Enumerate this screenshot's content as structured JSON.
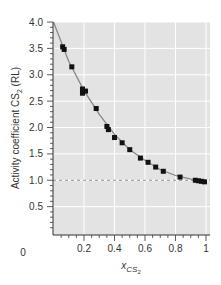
{
  "chart_data": {
    "type": "scatter",
    "title": "",
    "xlabel": "x_CS2",
    "ylabel": "Activity coefficient CS2 (RL)",
    "xlim": [
      0,
      1
    ],
    "ylim": [
      0,
      4.0
    ],
    "x_ticks": [
      "0",
      "0.2",
      "0.4",
      "0.6",
      "0.8",
      "1"
    ],
    "y_ticks": [
      "0.5",
      "1.0",
      "1.5",
      "2.0",
      "2.5",
      "3.0",
      "3.5",
      "4.0"
    ],
    "grid": true,
    "legend": null,
    "reference_line": {
      "y": 1.0,
      "style": "dashed"
    },
    "series": [
      {
        "name": "measured",
        "marker": "square",
        "x": [
          0.06,
          0.07,
          0.12,
          0.19,
          0.21,
          0.19,
          0.28,
          0.35,
          0.36,
          0.4,
          0.45,
          0.5,
          0.57,
          0.62,
          0.67,
          0.72,
          0.83,
          0.93,
          0.95,
          0.97,
          0.99
        ],
        "y": [
          3.53,
          3.48,
          3.15,
          2.73,
          2.69,
          2.65,
          2.36,
          2.02,
          1.96,
          1.81,
          1.71,
          1.58,
          1.42,
          1.34,
          1.25,
          1.17,
          1.06,
          1.0,
          0.99,
          0.98,
          0.97
        ]
      },
      {
        "name": "fit",
        "style": "line",
        "x": [
          0.0,
          0.1,
          0.2,
          0.3,
          0.4,
          0.5,
          0.6,
          0.7,
          0.8,
          0.9,
          1.0
        ],
        "y": [
          4.0,
          3.25,
          2.7,
          2.25,
          1.87,
          1.58,
          1.38,
          1.2,
          1.09,
          1.02,
          0.97
        ]
      }
    ]
  },
  "labels": {
    "ylabel_main": "Activity coefficient CS",
    "ylabel_sub": "2",
    "ylabel_tail": " (RL)",
    "xlabel_main": "x",
    "xlabel_sub1": "CS",
    "xlabel_sub2": "2",
    "x_zero": "0"
  },
  "colors": {
    "plot_bg": "#e3e3e3",
    "grid": "#ffffff",
    "marker": "#111111",
    "fit": "#888888",
    "reference": "#777777",
    "axis": "#333333"
  }
}
